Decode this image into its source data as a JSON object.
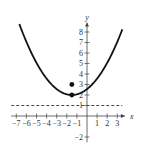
{
  "chart_data": {
    "type": "line",
    "title": "",
    "xlabel": "x",
    "ylabel": "y",
    "xlim": [
      -7.5,
      3.8
    ],
    "ylim": [
      -2.5,
      9
    ],
    "x_ticks": [
      -7,
      -6,
      -5,
      -4,
      -3,
      -2,
      -1,
      1,
      2,
      3
    ],
    "y_ticks": [
      -2,
      1,
      2,
      3,
      4,
      5,
      6,
      7,
      8
    ],
    "x_tick_labels": [
      "−7",
      "−6",
      "−5",
      "−4",
      "−3",
      "−2",
      "−1",
      "1",
      "2",
      "3"
    ],
    "y_tick_labels": [
      "−2",
      "1",
      "2",
      "3",
      "4",
      "5",
      "6",
      "7",
      "8"
    ],
    "grid": false,
    "series": [
      {
        "name": "parabola",
        "equation": "(x + 1.5)^2 = 4(y - 2)",
        "style": "solid",
        "color": "#111111",
        "x": [
          -6.7,
          -6,
          -5,
          -4,
          -3,
          -2,
          -1.5,
          -1,
          0,
          1,
          2,
          3,
          3.5
        ],
        "y": [
          8.76,
          7.06,
          5.06,
          3.56,
          2.56,
          2.06,
          2.0,
          2.06,
          2.56,
          3.56,
          5.06,
          7.06,
          8.25
        ]
      },
      {
        "name": "directrix",
        "equation": "y = 1",
        "style": "dashed",
        "color": "#333333",
        "x": [
          -7.5,
          3.5
        ],
        "y": [
          1,
          1
        ]
      }
    ],
    "points": [
      {
        "name": "vertex",
        "x": -1.5,
        "y": 2
      },
      {
        "name": "focus",
        "x": -1.5,
        "y": 3
      }
    ]
  }
}
